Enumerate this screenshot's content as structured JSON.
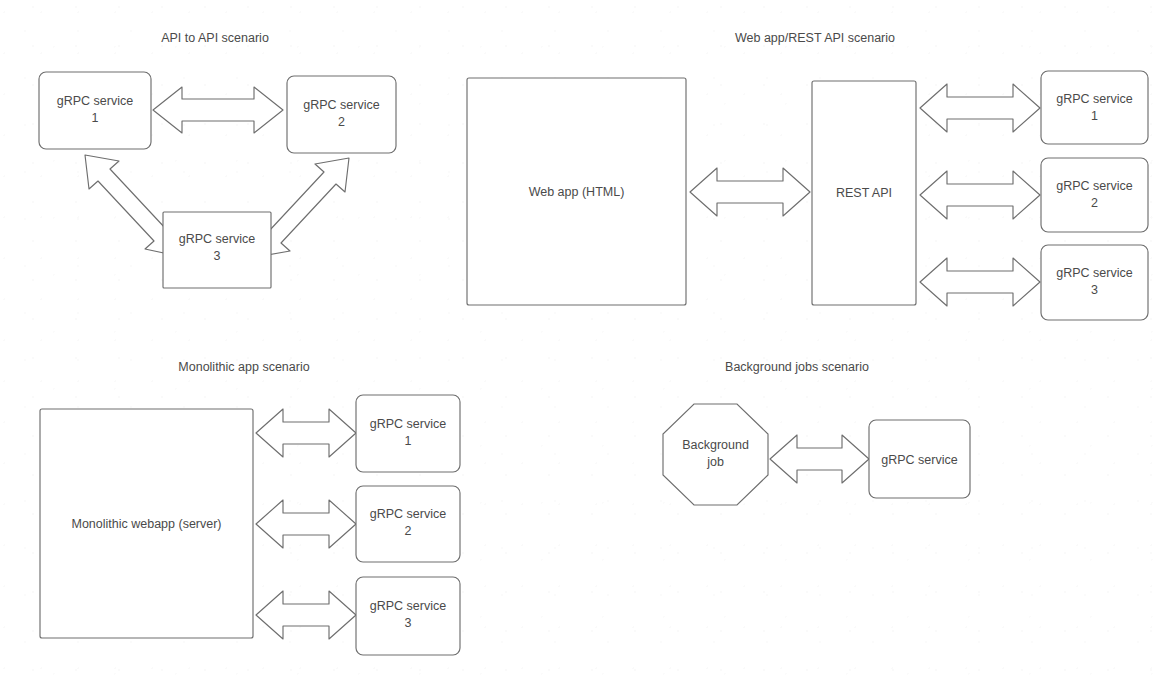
{
  "document": {
    "kind": "architecture-diagram",
    "description": "Four gRPC usage scenario diagrams",
    "stroke_color": "#6e6e6e",
    "text_color": "#4a4a4a",
    "background_color": "#ffffff"
  },
  "scenarios": [
    {
      "id": "api-to-api",
      "title": "API to API scenario",
      "title_x": 215,
      "title_y": 42,
      "nodes": [
        {
          "id": "grpc1",
          "shape": "rounded-rect",
          "label_line1": "gRPC service",
          "label_line2": "1",
          "x": 39,
          "y": 72,
          "w": 112,
          "h": 77
        },
        {
          "id": "grpc2",
          "shape": "rounded-rect",
          "label_line1": "gRPC service",
          "label_line2": "2",
          "x": 287,
          "y": 76,
          "w": 109,
          "h": 77
        },
        {
          "id": "grpc3",
          "shape": "rect",
          "label_line1": "gRPC service",
          "label_line2": "3",
          "x": 163,
          "y": 212,
          "w": 108,
          "h": 76
        }
      ],
      "connectors": [
        {
          "id": "grpc1-grpc2",
          "from": "grpc1",
          "to": "grpc2",
          "kind": "double-arrow",
          "orientation": "horizontal"
        },
        {
          "id": "grpc1-grpc3",
          "from": "grpc1",
          "to": "grpc3",
          "kind": "double-arrow",
          "orientation": "diagonal"
        },
        {
          "id": "grpc2-grpc3",
          "from": "grpc2",
          "to": "grpc3",
          "kind": "double-arrow",
          "orientation": "diagonal"
        }
      ]
    },
    {
      "id": "webapp-rest-api",
      "title": "Web app/REST API scenario",
      "title_x": 815,
      "title_y": 42,
      "nodes": [
        {
          "id": "webapp",
          "shape": "rect",
          "label_line1": "Web app (HTML)",
          "label_line2": "",
          "x": 467,
          "y": 78,
          "w": 219,
          "h": 227
        },
        {
          "id": "restapi",
          "shape": "rect",
          "label_line1": "REST API",
          "label_line2": "",
          "x": 812,
          "y": 81,
          "w": 104,
          "h": 224
        },
        {
          "id": "w-grpc1",
          "shape": "rounded-rect",
          "label_line1": "gRPC service",
          "label_line2": "1",
          "x": 1041,
          "y": 71,
          "w": 107,
          "h": 73
        },
        {
          "id": "w-grpc2",
          "shape": "rounded-rect",
          "label_line1": "gRPC service",
          "label_line2": "2",
          "x": 1041,
          "y": 158,
          "w": 107,
          "h": 74
        },
        {
          "id": "w-grpc3",
          "shape": "rounded-rect",
          "label_line1": "gRPC service",
          "label_line2": "3",
          "x": 1041,
          "y": 245,
          "w": 107,
          "h": 75
        }
      ],
      "connectors": [
        {
          "id": "webapp-restapi",
          "from": "webapp",
          "to": "restapi",
          "kind": "double-arrow",
          "orientation": "horizontal"
        },
        {
          "id": "restapi-grpc1",
          "from": "restapi",
          "to": "w-grpc1",
          "kind": "double-arrow",
          "orientation": "horizontal"
        },
        {
          "id": "restapi-grpc2",
          "from": "restapi",
          "to": "w-grpc2",
          "kind": "double-arrow",
          "orientation": "horizontal"
        },
        {
          "id": "restapi-grpc3",
          "from": "restapi",
          "to": "w-grpc3",
          "kind": "double-arrow",
          "orientation": "horizontal"
        }
      ]
    },
    {
      "id": "monolithic-app",
      "title": "Monolithic app scenario",
      "title_x": 244,
      "title_y": 371,
      "nodes": [
        {
          "id": "monolith",
          "shape": "rect",
          "label_line1": "Monolithic webapp (server)",
          "label_line2": "",
          "x": 40,
          "y": 409,
          "w": 213,
          "h": 229
        },
        {
          "id": "m-grpc1",
          "shape": "rounded-rect",
          "label_line1": "gRPC service",
          "label_line2": "1",
          "x": 356,
          "y": 395,
          "w": 104,
          "h": 77
        },
        {
          "id": "m-grpc2",
          "shape": "rounded-rect",
          "label_line1": "gRPC service",
          "label_line2": "2",
          "x": 356,
          "y": 486,
          "w": 104,
          "h": 76
        },
        {
          "id": "m-grpc3",
          "shape": "rounded-rect",
          "label_line1": "gRPC service",
          "label_line2": "3",
          "x": 356,
          "y": 577,
          "w": 104,
          "h": 78
        }
      ],
      "connectors": [
        {
          "id": "monolith-grpc1",
          "from": "monolith",
          "to": "m-grpc1",
          "kind": "double-arrow",
          "orientation": "horizontal"
        },
        {
          "id": "monolith-grpc2",
          "from": "monolith",
          "to": "m-grpc2",
          "kind": "double-arrow",
          "orientation": "horizontal"
        },
        {
          "id": "monolith-grpc3",
          "from": "monolith",
          "to": "m-grpc3",
          "kind": "double-arrow",
          "orientation": "horizontal"
        }
      ]
    },
    {
      "id": "background-jobs",
      "title": "Background jobs scenario",
      "title_x": 797,
      "title_y": 371,
      "nodes": [
        {
          "id": "bgjob",
          "shape": "octagon",
          "label_line1": "Background",
          "label_line2": "job",
          "x": 663,
          "y": 404,
          "w": 105,
          "h": 101
        },
        {
          "id": "b-grpc",
          "shape": "rounded-rect",
          "label_line1": "gRPC service",
          "label_line2": "",
          "x": 869,
          "y": 420,
          "w": 101,
          "h": 78
        }
      ],
      "connectors": [
        {
          "id": "bgjob-grpc",
          "from": "bgjob",
          "to": "b-grpc",
          "kind": "double-arrow",
          "orientation": "horizontal"
        }
      ]
    }
  ]
}
